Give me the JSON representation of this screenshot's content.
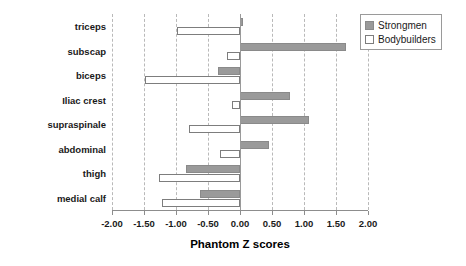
{
  "chart_data": {
    "type": "bar",
    "orientation": "horizontal",
    "title": "",
    "xlabel": "Phantom Z scores",
    "ylabel": "",
    "xlim": [
      -2.0,
      2.0
    ],
    "xticks": [
      "-2.00",
      "-1.50",
      "-1.00",
      "-0.50",
      "0.00",
      "0.50",
      "1.00",
      "1.50",
      "2.00"
    ],
    "xtick_values": [
      -2.0,
      -1.5,
      -1.0,
      -0.5,
      0.0,
      0.5,
      1.0,
      1.5,
      2.0
    ],
    "grid": "vertical-dashed",
    "legend_position": "top-right",
    "categories": [
      "triceps",
      "subscap",
      "biceps",
      "Iliac crest",
      "supraspinale",
      "abdominal",
      "thigh",
      "medial calf"
    ],
    "series": [
      {
        "name": "Strongmen",
        "color": "#9a9a9a",
        "values": [
          0.05,
          1.66,
          -0.35,
          0.78,
          1.08,
          0.45,
          -0.85,
          -0.62
        ]
      },
      {
        "name": "Bodybuilders",
        "color": "#ffffff",
        "values": [
          -0.98,
          -0.2,
          -1.48,
          -0.12,
          -0.8,
          -0.32,
          -1.27,
          -1.22
        ]
      }
    ]
  },
  "legend": {
    "items": [
      {
        "label": "Strongmen"
      },
      {
        "label": "Bodybuilders"
      }
    ]
  },
  "colors": {
    "strongmen": "#9a9a9a",
    "bodybuilders": "#ffffff",
    "axis": "#8d8d8d",
    "grid": "#b9b9b9",
    "text": "#1a1a1a"
  }
}
